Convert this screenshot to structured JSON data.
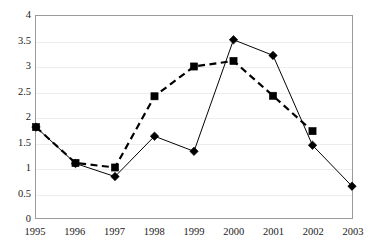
{
  "chart_data": {
    "type": "line",
    "title": "",
    "subtitle": "",
    "xlabel": "",
    "ylabel": "",
    "categories": [
      "1995",
      "1996",
      "1997",
      "1998",
      "1999",
      "2000",
      "2001",
      "2002",
      "2003"
    ],
    "ylim": [
      0,
      4
    ],
    "xlim": [
      "1995",
      "2003"
    ],
    "y_ticks": [
      "0",
      "0.5",
      "1",
      "1.5",
      "2",
      "2.5",
      "3",
      "3.5",
      "4"
    ],
    "y_tick_values": [
      0,
      0.5,
      1,
      1.5,
      2,
      2.5,
      3,
      3.5,
      4
    ],
    "x_ticks": [
      "1995",
      "1996",
      "1997",
      "1998",
      "1999",
      "2000",
      "2001",
      "2002",
      "2003"
    ],
    "grid": true,
    "grid_axis": "y",
    "legend": "none",
    "legend_position": "none",
    "series": [
      {
        "name": "series-1",
        "marker": "diamond",
        "line_style": "solid",
        "color": "#000000",
        "x": [
          "1995",
          "1996",
          "1997",
          "1998",
          "1999",
          "2000",
          "2001",
          "2002",
          "2003"
        ],
        "values": [
          1.8,
          1.08,
          0.82,
          1.62,
          1.32,
          3.53,
          3.22,
          1.44,
          0.63
        ]
      },
      {
        "name": "series-2",
        "marker": "square",
        "line_style": "dashed",
        "color": "#000000",
        "x": [
          "1995",
          "1996",
          "1997",
          "1998",
          "1999",
          "2000",
          "2001",
          "2002"
        ],
        "values": [
          1.8,
          1.09,
          1.0,
          2.41,
          3.0,
          3.11,
          2.42,
          1.72
        ]
      }
    ]
  },
  "style": {
    "background": "#ffffff",
    "frame_color": "#9a9a9a",
    "gridline_color": "#ededed",
    "text_color": "#1a1a1a"
  }
}
